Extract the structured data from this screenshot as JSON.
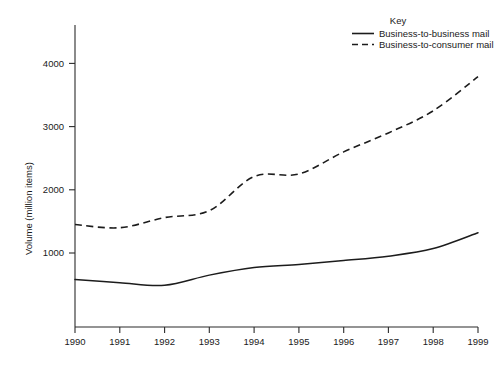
{
  "chart_data": {
    "type": "line",
    "title": "",
    "xlabel": "",
    "ylabel": "Volume (million items)",
    "xlim": [
      1990,
      1999
    ],
    "ylim": [
      0,
      4500
    ],
    "grid": false,
    "legend_position": "top-right",
    "legend_title": "Key",
    "x_ticks": [
      "1990",
      "1991",
      "1992",
      "1993",
      "1994",
      "1995",
      "1996",
      "1997",
      "1998",
      "1999"
    ],
    "y_ticks": [
      "1000",
      "2000",
      "3000",
      "4000"
    ],
    "x": [
      1990,
      1991,
      1992,
      1993,
      1994,
      1995,
      1996,
      1997,
      1998,
      1999
    ],
    "series": [
      {
        "name": "Business-to-business mail",
        "style": "solid",
        "color": "#1c1c1c",
        "values": [
          580,
          530,
          490,
          650,
          770,
          820,
          880,
          950,
          1070,
          1320
        ]
      },
      {
        "name": "Business-to-consumer mail",
        "style": "dashed",
        "color": "#1c1c1c",
        "values": [
          1450,
          1400,
          1560,
          1670,
          2210,
          2250,
          2600,
          2900,
          3250,
          3790
        ]
      }
    ]
  },
  "legend": {
    "title": "Key",
    "entries": [
      {
        "label": "Business-to-business mail",
        "style": "solid"
      },
      {
        "label": "Business-to-consumer mail",
        "style": "dashed"
      }
    ]
  },
  "axes": {
    "y_title": "Volume (million items)",
    "y_tick_labels": [
      "4000",
      "3000",
      "2000",
      "1000"
    ],
    "x_tick_labels": [
      "1990",
      "1991",
      "1992",
      "1993",
      "1994",
      "1995",
      "1996",
      "1997",
      "1998",
      "1999"
    ]
  }
}
